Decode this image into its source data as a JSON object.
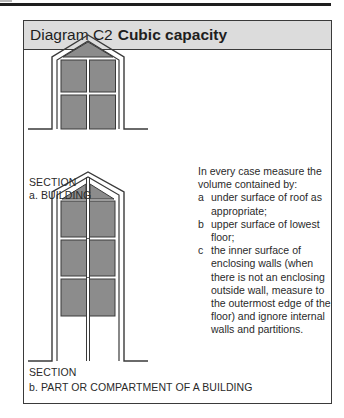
{
  "title": {
    "prefix": "Diagram C2",
    "bold": "Cubic capacity"
  },
  "section_a": {
    "section_label": "SECTION",
    "caption": "a. BUILDING"
  },
  "section_b": {
    "section_label": "SECTION",
    "caption": "b. PART OR COMPARTMENT OF A BUILDING"
  },
  "explanation": {
    "intro": "In every case measure the volume contained by:",
    "items": [
      {
        "mark": "a",
        "text": "under surface of roof as appropriate;"
      },
      {
        "mark": "b",
        "text": "upper surface of lowest floor;"
      },
      {
        "mark": "c",
        "text": "the inner surface of enclosing walls (when there is not an enclosing outside wall, measure to the outermost edge of the floor) and ignore internal walls and partitions."
      }
    ]
  },
  "colors": {
    "header_bg": "#dcdcdc",
    "volume_fill": "#8c8c8c",
    "line": "#3a3a3a"
  }
}
